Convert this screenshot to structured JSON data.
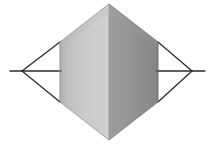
{
  "figure": {
    "title": "",
    "background_color": "#ffffff",
    "width": 213,
    "height": 144
  },
  "palette": {
    "face_left_light": "#cccccc",
    "face_left_dark": "#b4b4b4",
    "face_right_light": "#9a9a9a",
    "face_right_dark": "#848484",
    "top_left_facet": "#c2c2c2",
    "top_right_facet": "#9f9f9f",
    "stroke": "#2b2b2b",
    "edge_stroke": "#6e6e6e",
    "background": "#ffffff"
  },
  "geometry": {
    "hexagon": {
      "name": "shaded-hexagonal-prism",
      "apex_top": [
        109,
        4
      ],
      "apex_bottom": [
        109,
        140
      ],
      "left_top": [
        60,
        42
      ],
      "left_bottom": [
        60,
        102
      ],
      "right_top": [
        158,
        42
      ],
      "right_bottom": [
        158,
        102
      ],
      "center_seam_x": 109
    },
    "left_triangle": {
      "name": "left-wireframe-triangle",
      "apex": [
        22,
        71
      ],
      "upper_point": [
        60,
        42
      ],
      "lower_point": [
        60,
        102
      ]
    },
    "right_triangle": {
      "name": "right-wireframe-triangle",
      "apex": [
        192,
        71
      ],
      "upper_point": [
        158,
        42
      ],
      "lower_point": [
        158,
        102
      ]
    },
    "axis_lines": [
      {
        "name": "left-axis-line",
        "from": [
          10,
          71
        ],
        "to": [
          22,
          71
        ]
      },
      {
        "name": "left-inner-axis-line",
        "from": [
          22,
          71
        ],
        "to": [
          60,
          71
        ]
      },
      {
        "name": "right-inner-axis-line",
        "from": [
          158,
          71
        ],
        "to": [
          192,
          71
        ]
      },
      {
        "name": "right-axis-line",
        "from": [
          192,
          71
        ],
        "to": [
          205,
          71
        ]
      }
    ],
    "stroke_width": 1.3
  },
  "labels": {
    "apex_top": "",
    "apex_bottom": "",
    "left_vertex": "",
    "right_vertex": "",
    "caption": ""
  }
}
